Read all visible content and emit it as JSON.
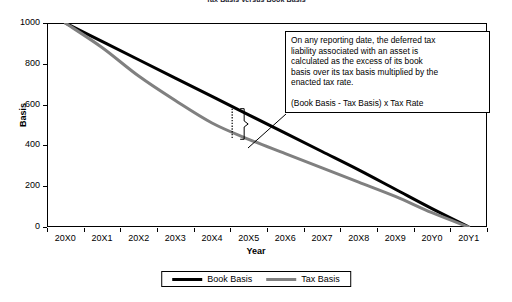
{
  "chart_data": {
    "type": "line",
    "title": "Tax Basis versus Book Basis",
    "xlabel": "Year",
    "ylabel": "Basis",
    "categories": [
      "20X0",
      "20X1",
      "20X2",
      "20X3",
      "20X4",
      "20X5",
      "20X6",
      "20X7",
      "20X8",
      "20X9",
      "20Y0",
      "20Y1"
    ],
    "ylim": [
      0,
      1000
    ],
    "yticks": [
      0,
      200,
      400,
      600,
      800,
      1000
    ],
    "ytick_labels": [
      "0",
      "200",
      "400",
      "600",
      "800",
      "1000"
    ],
    "xlim_labels": [
      "20X0",
      "20Y1"
    ],
    "grid": false,
    "legend_position": "bottom-center",
    "series": [
      {
        "name": "Book Basis",
        "color": "#000000",
        "width": 3,
        "values": [
          1000,
          910,
          820,
          730,
          640,
          550,
          460,
          370,
          280,
          185,
          90,
          0
        ]
      },
      {
        "name": "Tax Basis",
        "color": "#808080",
        "width": 3,
        "values": [
          1000,
          880,
          740,
          620,
          510,
          430,
          360,
          290,
          220,
          150,
          70,
          0
        ]
      }
    ],
    "annotations": [
      {
        "name": "deferred-tax-callout",
        "paragraphs": [
          "On any reporting date, the deferred tax liability associated with an asset is calculated as the excess of its book basis over its tax basis multiplied by the enacted tax rate.",
          "(Book Basis - Tax Basis) x Tax Rate"
        ],
        "marker": "dotted-vertical-bracket",
        "marker_category": "20X4",
        "marker_range": [
          430,
          580
        ]
      }
    ]
  },
  "legend": {
    "items": [
      {
        "label": "Book Basis",
        "color": "#000000"
      },
      {
        "label": "Tax Basis",
        "color": "#808080"
      }
    ]
  },
  "annotation": {
    "line1": "On any reporting date, the deferred tax",
    "line2": "liability associated with an asset is",
    "line3": "calculated as the excess of its book",
    "line4": "basis over its tax basis multiplied by the",
    "line5": "enacted tax rate.",
    "formula": "(Book Basis - Tax Basis) x Tax Rate"
  }
}
